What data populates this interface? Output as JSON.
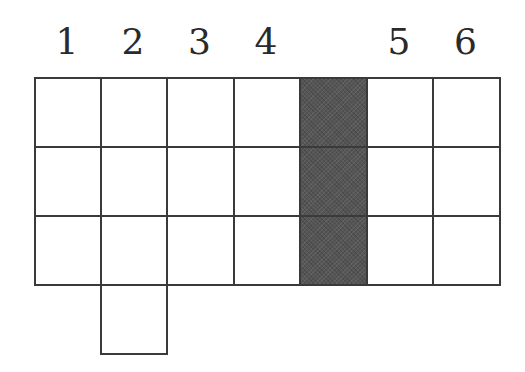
{
  "diagram": {
    "column_labels": [
      "1",
      "2",
      "3",
      "4",
      "",
      "5",
      "6"
    ],
    "colors": {
      "line": "#3a3a3a",
      "shaded": "#555555",
      "background": "#ffffff"
    },
    "grid": {
      "columns": 7,
      "rows": 3,
      "shaded_column_index": 4,
      "extra_cells": [
        {
          "row": 3,
          "column": 1
        }
      ]
    }
  }
}
